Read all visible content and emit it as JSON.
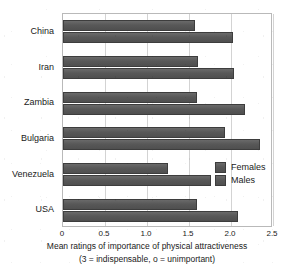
{
  "chart_data": {
    "type": "bar",
    "orientation": "horizontal",
    "title": "",
    "xlabel": "Mean ratings of importance of physical attractiveness",
    "xsublabel": "(3 = indispensable, o = unimportant)",
    "ylabel": "",
    "categories": [
      "China",
      "Iran",
      "Zambia",
      "Bulgaria",
      "Venezuela",
      "USA"
    ],
    "series": [
      {
        "name": "Females",
        "values": [
          1.57,
          1.61,
          1.59,
          1.93,
          1.25,
          1.6
        ]
      },
      {
        "name": "Males",
        "values": [
          2.02,
          2.03,
          2.17,
          2.35,
          1.76,
          2.08
        ]
      }
    ],
    "xlim": [
      0,
      2.5
    ],
    "xticks": [
      0,
      0.5,
      1.0,
      1.5,
      2.0,
      2.5
    ],
    "xtick_labels": [
      "0",
      "0.5",
      "1.0",
      "1.5",
      "2.0",
      "2.5"
    ],
    "grid": true,
    "grid_axis": "x",
    "legend_position": "center-right",
    "colors": {
      "bar_fill": "#5a5a5a",
      "bar_edge": "#3d3d3d",
      "gridline": "#d3d3d3",
      "frame": "#b9b9b9",
      "background": "#ffffff",
      "text": "#1a1a1a"
    }
  },
  "legend": {
    "items": [
      {
        "label": "Females"
      },
      {
        "label": "Males"
      }
    ]
  }
}
